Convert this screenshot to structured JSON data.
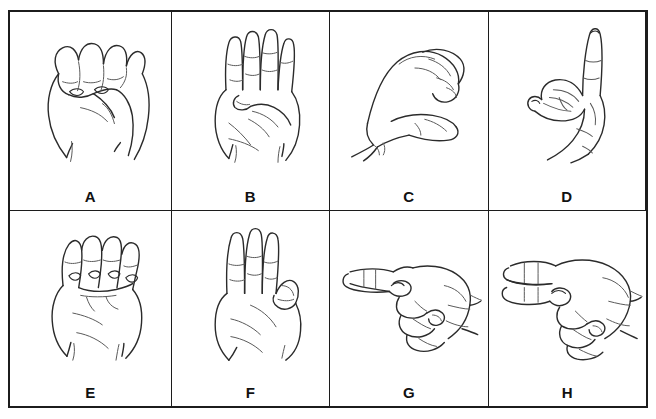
{
  "chart": {
    "type": "image-grid",
    "rows": 2,
    "columns": 4,
    "background_color": "#ffffff",
    "border_color": "#1c1c1c",
    "label_color": "#111111",
    "stroke_color": "#3a3a3a"
  },
  "cells": [
    {
      "id": "cell-a",
      "label": "A",
      "icon_name": "asl-hand-sign-a",
      "description": "Closed fist, thumb resting along the side, front view"
    },
    {
      "id": "cell-b",
      "label": "B",
      "icon_name": "asl-hand-sign-b",
      "description": "Four fingers straight up together, thumb folded across palm"
    },
    {
      "id": "cell-c",
      "label": "C",
      "icon_name": "asl-hand-sign-c",
      "description": "Hand curved into a C shape, side view"
    },
    {
      "id": "cell-d",
      "label": "D",
      "icon_name": "asl-hand-sign-d",
      "description": "Index finger pointing up, other fingers meeting thumb in a circle"
    },
    {
      "id": "cell-e",
      "label": "E",
      "icon_name": "asl-hand-sign-e",
      "description": "Fingers bent down over the thumb, front view"
    },
    {
      "id": "cell-f",
      "label": "F",
      "icon_name": "asl-hand-sign-f",
      "description": "Three fingers up, index and thumb touching in a circle"
    },
    {
      "id": "cell-g",
      "label": "G",
      "icon_name": "asl-hand-sign-g",
      "description": "Index finger pointing sideways, thumb alongside, side view"
    },
    {
      "id": "cell-h",
      "label": "H",
      "icon_name": "asl-hand-sign-h",
      "description": "Index and middle fingers extended sideways together, side view"
    }
  ]
}
